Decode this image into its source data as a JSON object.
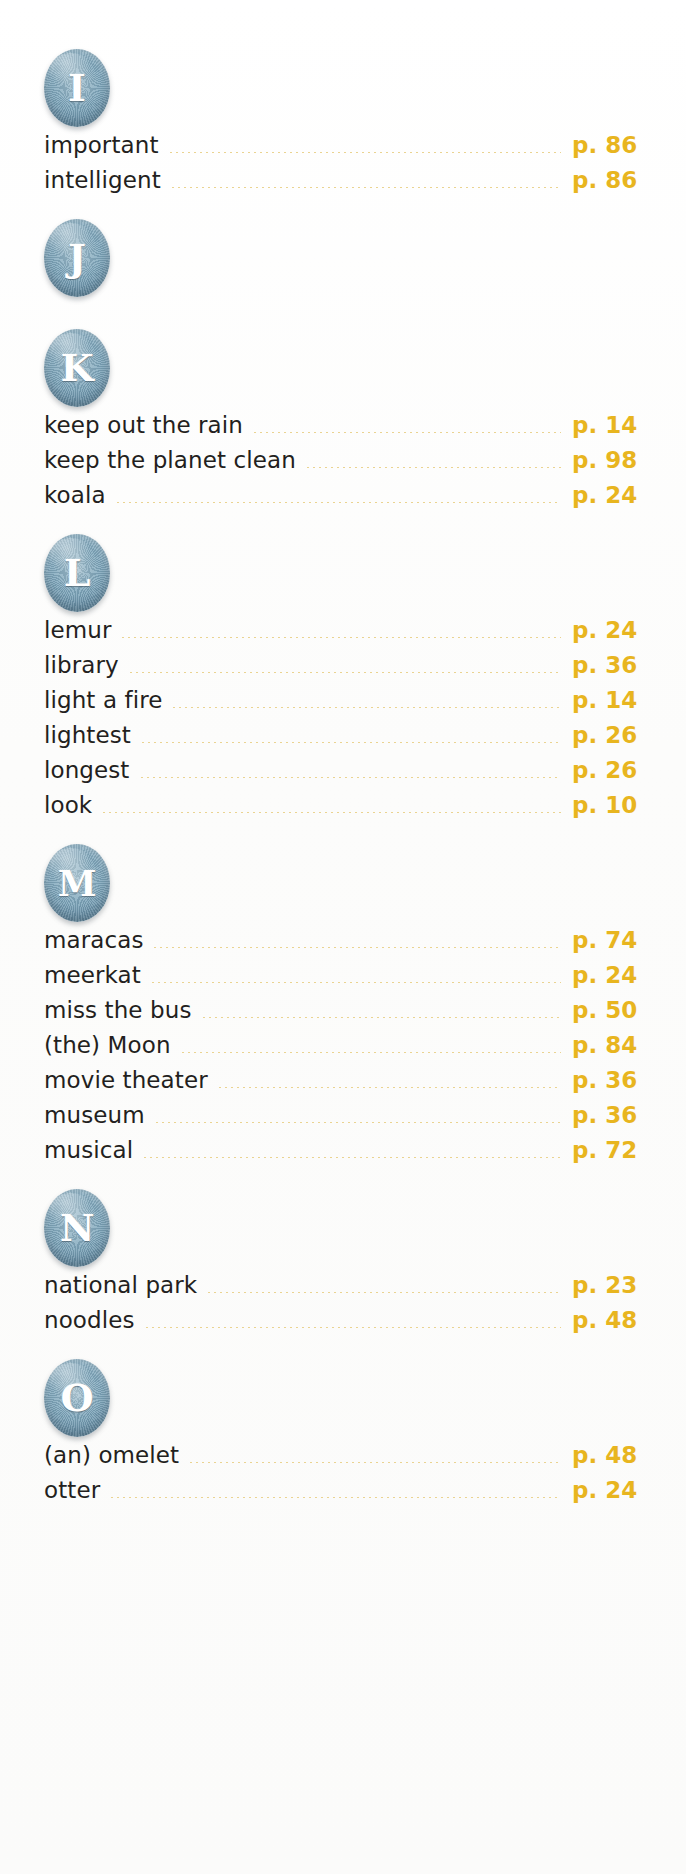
{
  "document": {
    "type": "alphabetical-index",
    "page_label_prefix": "p.",
    "colors": {
      "badge_blue": "#7ea6bb",
      "page_number_gold": "#e8b51f",
      "leader_dot_gold": "#e8cf86",
      "entry_text": "#231f20",
      "background": "#fdfdfc"
    }
  },
  "sections": [
    {
      "letter": "I",
      "badge_name": "letter-badge-i",
      "entries": [
        {
          "word": "important",
          "page": "p. 86"
        },
        {
          "word": "intelligent",
          "page": "p. 86"
        }
      ]
    },
    {
      "letter": "J",
      "badge_name": "letter-badge-j",
      "entries": []
    },
    {
      "letter": "K",
      "badge_name": "letter-badge-k",
      "entries": [
        {
          "word": "keep out the rain",
          "page": "p. 14"
        },
        {
          "word": "keep the planet clean",
          "page": "p. 98"
        },
        {
          "word": "koala",
          "page": "p. 24"
        }
      ]
    },
    {
      "letter": "L",
      "badge_name": "letter-badge-l",
      "entries": [
        {
          "word": "lemur",
          "page": "p. 24"
        },
        {
          "word": "library",
          "page": "p. 36"
        },
        {
          "word": "light a fire",
          "page": "p. 14"
        },
        {
          "word": "lightest",
          "page": "p. 26"
        },
        {
          "word": "longest",
          "page": "p. 26"
        },
        {
          "word": "look",
          "page": "p. 10"
        }
      ]
    },
    {
      "letter": "M",
      "badge_name": "letter-badge-m",
      "entries": [
        {
          "word": "maracas",
          "page": "p. 74"
        },
        {
          "word": "meerkat",
          "page": "p. 24"
        },
        {
          "word": "miss the bus",
          "page": "p. 50"
        },
        {
          "word": "(the) Moon",
          "page": "p. 84"
        },
        {
          "word": "movie theater",
          "page": "p. 36"
        },
        {
          "word": "museum",
          "page": "p. 36"
        },
        {
          "word": "musical",
          "page": "p. 72"
        }
      ]
    },
    {
      "letter": "N",
      "badge_name": "letter-badge-n",
      "entries": [
        {
          "word": "national park",
          "page": "p. 23"
        },
        {
          "word": "noodles",
          "page": "p. 48"
        }
      ]
    },
    {
      "letter": "O",
      "badge_name": "letter-badge-o",
      "entries": [
        {
          "word": "(an) omelet",
          "page": "p. 48"
        },
        {
          "word": "otter",
          "page": "p. 24"
        }
      ]
    }
  ]
}
